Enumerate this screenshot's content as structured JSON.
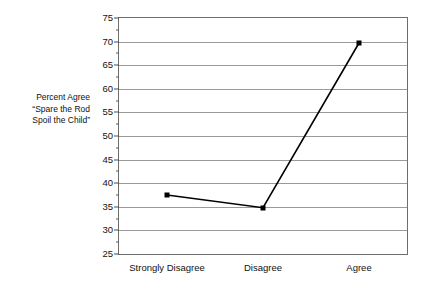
{
  "chart_data": {
    "type": "line",
    "title": "",
    "xlabel": "",
    "ylabel": "Percent Agree \"Spare the Rod Spoil the Child\"",
    "ylabel_lines": [
      "Percent Agree",
      "“Spare the Rod",
      "Spoil the Child”"
    ],
    "categories": [
      "Strongly Disagree",
      "Disagree",
      "Agree"
    ],
    "values": [
      37.5,
      34.8,
      69.7
    ],
    "series": [
      {
        "name": "Percent Agree",
        "values": [
          37.5,
          34.8,
          69.7
        ]
      }
    ],
    "ylim": [
      25,
      75
    ],
    "y_ticks": [
      25,
      30,
      35,
      40,
      45,
      50,
      55,
      60,
      65,
      70,
      75
    ],
    "y_tick_labels": [
      "25",
      "30",
      "35",
      "40",
      "45",
      "50",
      "55",
      "60",
      "65",
      "70",
      "75"
    ],
    "y_minor_tick_step": 2.5,
    "grid": true,
    "grid_axis": "y",
    "legend": false,
    "legend_position": "none",
    "marker": "square",
    "line_color": "#000000",
    "marker_color": "#000000",
    "grid_color": "#9a9a9a",
    "axis_color": "#6d6d6d",
    "background_color": "#ffffff"
  }
}
